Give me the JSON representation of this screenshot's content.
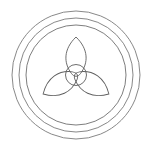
{
  "canvas": {
    "width": 152,
    "height": 153,
    "background_color": "#ffffff",
    "title": "Trefoil Circle Motif"
  },
  "figure": {
    "name": "concentric-trefoil-emblem",
    "stroke_color": "#6b6b6b",
    "stroke_width": 0.9,
    "center": {
      "x": 76,
      "y": 75
    }
  },
  "rings": [
    {
      "name": "outer-ring",
      "radius": 64,
      "stroke_color": "#7a7a7a",
      "stroke_width": 0.9
    },
    {
      "name": "middle-ring",
      "radius": 57,
      "stroke_color": "#7a7a7a",
      "stroke_width": 0.9
    },
    {
      "name": "inner-ring",
      "radius": 50,
      "stroke_color": "#6f6f6f",
      "stroke_width": 0.9
    }
  ],
  "core_circle": {
    "name": "center-circle",
    "radius": 10.5,
    "stroke_color": "#5f5f5f",
    "stroke_width": 0.9
  },
  "petals": [
    {
      "name": "petal-top",
      "angle_deg": 0,
      "tip_distance": 38,
      "half_width": 10.5,
      "stroke_color": "#5f5f5f"
    },
    {
      "name": "petal-lower-right",
      "angle_deg": 120,
      "tip_distance": 38,
      "half_width": 10.5,
      "stroke_color": "#5f5f5f"
    },
    {
      "name": "petal-lower-left",
      "angle_deg": 240,
      "tip_distance": 38,
      "half_width": 10.5,
      "stroke_color": "#5f5f5f"
    }
  ],
  "geometry_notes": {
    "petal_count": 3,
    "symmetry": "3-fold rotational",
    "ring_count": 3
  }
}
